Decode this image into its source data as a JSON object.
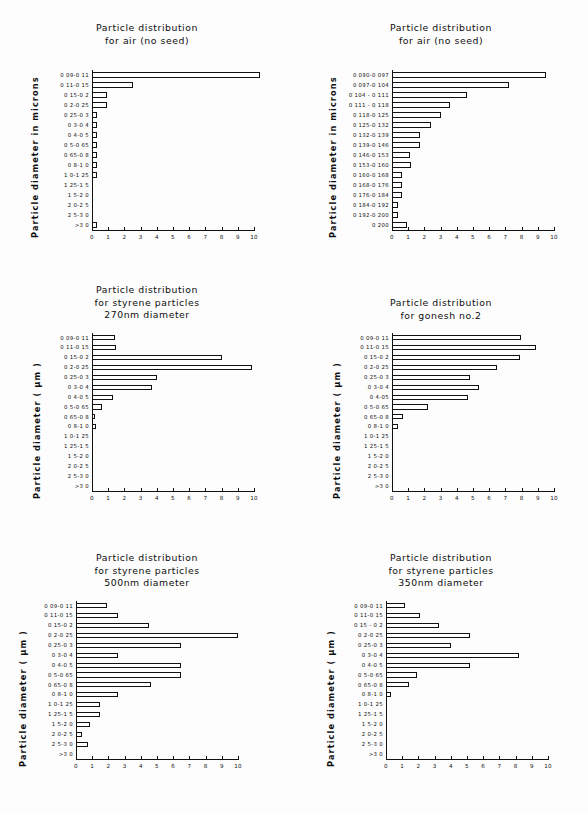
{
  "figure": {
    "background": "#fdfdfd",
    "ink": "#111111",
    "panel_count": 6
  },
  "common": {
    "xlabel": "",
    "xticks": [
      "0",
      "1",
      "2",
      "3",
      "4",
      "5",
      "6",
      "7",
      "8",
      "9",
      "10"
    ],
    "xlim": [
      0,
      10
    ],
    "categories_micron": [
      "0 09-0 11",
      "0 11-0 15",
      "0 15-0 2",
      "0 2-0 25",
      "0 25-0 3",
      "0 3-0 4",
      "0 4-0 5",
      "0 5-0 65",
      "0 65-0 8",
      "0 8-1 0",
      "1 0-1 25",
      "1 25-1 5",
      "1 5-2 0",
      "2 0-2 5",
      "2 5-3 0",
      ">3 0"
    ],
    "categories_fine": [
      "0 090-0 097",
      "0 097-0 104",
      "0 104 - 0 111",
      "0 111 - 0 118",
      "0 118-0 125",
      "0 125-0 132",
      "0 132-0 139",
      "0 139-0 146",
      "0 146-0 153",
      "0 153-0 160",
      "0 160-0 168",
      "0 168-0 176",
      "0 176-0 184",
      "0 184-0 192",
      "0 192-0 200",
      "0 200"
    ],
    "ylabel_microns": "Particle diameter in microns",
    "ylabel_um": "Particle diameter ( µm )"
  },
  "chart_data": [
    {
      "id": "air-no-seed-coarse",
      "type": "bar",
      "orientation": "horizontal",
      "title": [
        "Particle distribution",
        "for air (no seed)"
      ],
      "xlabel": "",
      "ylabel": "Particle diameter in microns",
      "xlim": [
        0,
        10
      ],
      "xticks": [
        "0",
        "1",
        "2",
        "3",
        "4",
        "5",
        "6",
        "7",
        "8",
        "9",
        "10"
      ],
      "grid": false,
      "legend": "none",
      "categories": [
        "0 09-0 11",
        "0 11-0 15",
        "0 15-0 2",
        "0 2-0 25",
        "0 25-0 3",
        "0 3-0 4",
        "0 4-0 5",
        "0 5-0 65",
        "0 65-0 8",
        "0 8-1 0",
        "1 0-1 25",
        "1 25-1 5",
        "1 5-2 0",
        "2 0-2 5",
        "2 5-3 0",
        ">3 0"
      ],
      "values": [
        10.4,
        2.5,
        0.95,
        0.95,
        0.3,
        0.3,
        0.3,
        0.3,
        0.3,
        0.3,
        0.3,
        0,
        0,
        0,
        0,
        0.3
      ]
    },
    {
      "id": "air-no-seed-fine",
      "type": "bar",
      "orientation": "horizontal",
      "title": [
        "Particle distribution",
        "for air (no seed)"
      ],
      "xlabel": "",
      "ylabel": "Particle diameter in microns",
      "xlim": [
        0,
        10
      ],
      "xticks": [
        "0",
        "1",
        "2",
        "3",
        "4",
        "5",
        "6",
        "7",
        "8",
        "9",
        "10"
      ],
      "grid": false,
      "legend": "none",
      "categories": [
        "0 090-0 097",
        "0 097-0 104",
        "0 104 - 0 111",
        "0 111 - 0 118",
        "0 118-0 125",
        "0 125-0 132",
        "0 132-0 139",
        "0 139-0 146",
        "0 146-0 153",
        "0 153-0 160",
        "0 160-0 168",
        "0 168-0 176",
        "0 176-0 184",
        "0 184-0 192",
        "0 192-0 200",
        "0 200"
      ],
      "values": [
        9.5,
        7.2,
        4.6,
        3.6,
        3.05,
        2.4,
        1.7,
        1.75,
        1.1,
        1.15,
        0.6,
        0.6,
        0.6,
        0.35,
        0.35,
        0.95
      ]
    },
    {
      "id": "styrene-270nm",
      "type": "bar",
      "orientation": "horizontal",
      "title": [
        "Particle distribution",
        "for styrene particles",
        "270nm diameter"
      ],
      "xlabel": "",
      "ylabel": "Particle diameter ( µm )",
      "xlim": [
        0,
        10
      ],
      "xticks": [
        "0",
        "1",
        "2",
        "3",
        "4",
        "5",
        "6",
        "7",
        "8",
        "9",
        "10"
      ],
      "grid": false,
      "legend": "none",
      "categories": [
        "0 09-0 11",
        "0 11-0 15",
        "0 15-0 2",
        "0 2-0 25",
        "0 25-0 3",
        "0 3-0 4",
        "0 4-0 5",
        "0 5-0 65",
        "0 65-0 8",
        "0 8-1 0",
        "1 0-1 25",
        "1 25-1 5",
        "1 5-2 0",
        "2 0-2 5",
        "2 5-3 0",
        ">3 0"
      ],
      "values": [
        1.45,
        1.5,
        8.0,
        9.85,
        4.0,
        3.7,
        1.3,
        0.6,
        0.2,
        0.25,
        0,
        0,
        0,
        0,
        0,
        0
      ]
    },
    {
      "id": "gonesh-no-2",
      "type": "bar",
      "orientation": "horizontal",
      "title": [
        "Particle distribution",
        "for gonesh no.2"
      ],
      "xlabel": "",
      "ylabel": "Particle diameter ( µm )",
      "xlim": [
        0,
        10
      ],
      "xticks": [
        "0",
        "1",
        "2",
        "3",
        "4",
        "5",
        "6",
        "7",
        "8",
        "9",
        "10"
      ],
      "grid": false,
      "legend": "none",
      "categories": [
        "0 09-0 11",
        "0 11-0 15",
        "0 15-0 2",
        "0 2-0 25",
        "0 25-0 3",
        "0 3-0 4",
        "0 4-05",
        "0 5-0 65",
        "0 65-0 8",
        "0 8-1 0",
        "1 0-1 25",
        "1 25-1 5",
        "1 5-2 0",
        "2 0-2 5",
        "2 5-3 0",
        ">3 0"
      ],
      "values": [
        7.95,
        8.9,
        7.9,
        6.5,
        4.8,
        5.4,
        4.7,
        2.2,
        0.65,
        0.4,
        0,
        0,
        0,
        0,
        0,
        0
      ]
    },
    {
      "id": "styrene-500nm",
      "type": "bar",
      "orientation": "horizontal",
      "title": [
        "Particle distribution",
        "for styrene particles",
        "500nm diameter"
      ],
      "xlabel": "",
      "ylabel": "Particle diameter ( µm )",
      "xlim": [
        0,
        10
      ],
      "xticks": [
        "0",
        "1",
        "2",
        "3",
        "4",
        "5",
        "6",
        "7",
        "8",
        "9",
        "10"
      ],
      "grid": false,
      "legend": "none",
      "categories": [
        "0 09-0 11",
        "0 11-0 15",
        "0 15-0 2",
        "0 2-0 25",
        "0 25-0 3",
        "0 3-0 4",
        "0 4-0 5",
        "0 5-0 65",
        "0 65-0 8",
        "0 8-1 0",
        "1 0-1 25",
        "1 25-1 5",
        "1 5-2 0",
        "2 0-2 5",
        "2 5-3 0",
        ">3 0"
      ],
      "values": [
        1.9,
        2.6,
        4.5,
        10.0,
        6.5,
        2.6,
        6.5,
        6.5,
        4.6,
        2.6,
        1.5,
        1.5,
        0.85,
        0.4,
        0.75,
        0
      ]
    },
    {
      "id": "styrene-350nm",
      "type": "bar",
      "orientation": "horizontal",
      "title": [
        "Particle distribution",
        "for styrene particles",
        "350nm diameter"
      ],
      "xlabel": "",
      "ylabel": "Particle diameter ( µm )",
      "xlim": [
        0,
        10
      ],
      "xticks": [
        "0",
        "1",
        "2",
        "3",
        "4",
        "5",
        "6",
        "7",
        "8",
        "9",
        "10"
      ],
      "grid": false,
      "legend": "none",
      "categories": [
        "0 09-0 11",
        "0 11-0 15",
        "0 15 - 0 2",
        "0 2-0 25",
        "0 25-0 3",
        "0 3-0 4",
        "0 4-0 5",
        "0 5-0 65",
        "0 65-0 8",
        "0 8-1 0",
        "1 0-1 25",
        "1 25-1 5",
        "1 5-2 0",
        "2 0-2 5",
        "2 5-3 0",
        ">3 0"
      ],
      "values": [
        1.2,
        2.1,
        3.3,
        5.2,
        4.0,
        8.2,
        5.2,
        1.9,
        1.4,
        0.3,
        0,
        0,
        0,
        0,
        0,
        0
      ]
    }
  ],
  "panels": [
    {
      "left": 0,
      "top": 0,
      "plotLeft": 92,
      "plotTop": 70,
      "plotW": 162,
      "plotH": 160,
      "catW": 50,
      "titleTop": 22,
      "ylabelLeft": 30,
      "ylabelBottom": 238,
      "ylabelKey": "microns"
    },
    {
      "left": 294,
      "top": 0,
      "plotLeft": 98,
      "plotTop": 70,
      "plotW": 162,
      "plotH": 160,
      "catW": 58,
      "titleTop": 22,
      "ylabelLeft": 34,
      "ylabelBottom": 238,
      "ylabelKey": "microns"
    },
    {
      "left": 0,
      "top": 281,
      "plotLeft": 92,
      "plotTop": 52,
      "plotW": 162,
      "plotH": 158,
      "catW": 50,
      "titleTop": 3,
      "ylabelLeft": 32,
      "ylabelBottom": 218,
      "ylabelKey": "um"
    },
    {
      "left": 294,
      "top": 281,
      "plotLeft": 98,
      "plotTop": 52,
      "plotW": 162,
      "plotH": 158,
      "catW": 52,
      "titleTop": 16,
      "ylabelLeft": 38,
      "ylabelBottom": 218,
      "ylabelKey": "um"
    },
    {
      "left": 0,
      "top": 546,
      "plotLeft": 76,
      "plotTop": 55,
      "plotW": 162,
      "plotH": 158,
      "catW": 50,
      "titleTop": 6,
      "ylabelLeft": 18,
      "ylabelBottom": 221,
      "ylabelKey": "um"
    },
    {
      "left": 294,
      "top": 546,
      "plotLeft": 92,
      "plotTop": 55,
      "plotW": 162,
      "plotH": 158,
      "catW": 52,
      "titleTop": 6,
      "ylabelLeft": 32,
      "ylabelBottom": 221,
      "ylabelKey": "um"
    }
  ]
}
